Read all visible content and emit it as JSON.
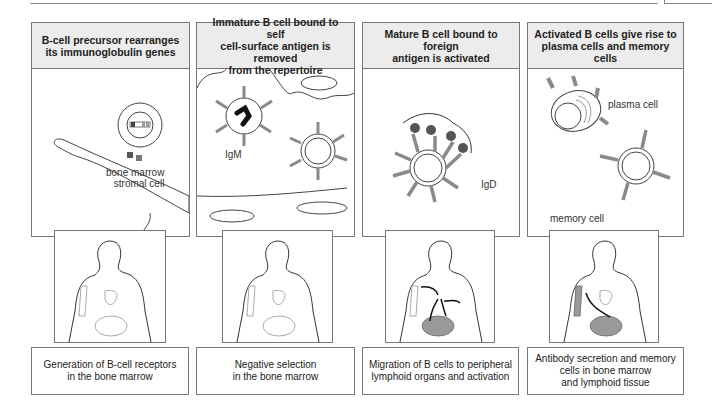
{
  "figure": {
    "panels": [
      {
        "title": "B-cell precursor rearranges\nits immunoglobulin genes",
        "labels": [
          "bone marrow\nstromal cell"
        ],
        "caption": "Generation of B-cell receptors\nin the bone marrow"
      },
      {
        "title": "Immature B cell bound to self\ncell-surface antigen is removed\nfrom the repertoire",
        "labels": [
          "IgM"
        ],
        "caption": "Negative selection\nin the bone marrow"
      },
      {
        "title": "Mature B cell bound to foreign\nantigen is activated",
        "labels": [
          "IgD"
        ],
        "caption": "Migration of B cells to peripheral\nlymphoid organs and activation"
      },
      {
        "title": "Activated B cells give rise to\nplasma cells and memory cells",
        "labels": [
          "plasma cell",
          "memory cell"
        ],
        "caption": "Antibody secretion and memory\ncells in bone marrow\nand lymphoid tissue"
      }
    ],
    "colors": {
      "border": "#777777",
      "header_bg": "#ececec",
      "antibody": "#8a8a8a",
      "antigen": "#555555",
      "organ": "#999999"
    }
  }
}
